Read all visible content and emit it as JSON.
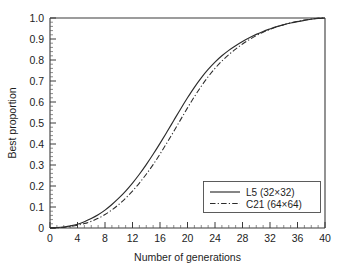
{
  "chart_data": {
    "type": "line",
    "title": "",
    "xlabel": "Number of generations",
    "ylabel": "Best proportion",
    "xlim": [
      0,
      40
    ],
    "ylim": [
      0,
      1.0
    ],
    "grid": false,
    "legend_position": "lower right",
    "x_ticks": [
      0,
      4,
      8,
      12,
      16,
      20,
      24,
      28,
      32,
      36,
      40
    ],
    "x_tick_labels": [
      "0",
      "4",
      "8",
      "12",
      "16",
      "20",
      "24",
      "28",
      "32",
      "36",
      "40"
    ],
    "x_minor_tick_step": 1,
    "y_ticks": [
      0,
      0.1,
      0.2,
      0.3,
      0.4,
      0.5,
      0.6,
      0.7,
      0.8,
      0.9,
      1.0
    ],
    "y_tick_labels": [
      "0",
      "0.1",
      "0.2",
      "0.3",
      "0.4",
      "0.5",
      "0.6",
      "0.7",
      "0.8",
      "0.9",
      "1.0"
    ],
    "y_minor_tick_step": 0.02,
    "x": [
      0,
      1,
      2,
      3,
      4,
      5,
      6,
      7,
      8,
      9,
      10,
      11,
      12,
      13,
      14,
      15,
      16,
      17,
      18,
      19,
      20,
      21,
      22,
      23,
      24,
      25,
      26,
      27,
      28,
      29,
      30,
      31,
      32,
      33,
      34,
      35,
      36,
      37,
      38,
      39,
      40
    ],
    "series": [
      {
        "name": "L5 (32×32)",
        "style": "solid",
        "color": "#2b2b2b",
        "values": [
          0.0,
          0.002,
          0.005,
          0.01,
          0.018,
          0.03,
          0.045,
          0.063,
          0.085,
          0.112,
          0.142,
          0.176,
          0.214,
          0.256,
          0.302,
          0.351,
          0.403,
          0.457,
          0.512,
          0.567,
          0.62,
          0.67,
          0.715,
          0.755,
          0.79,
          0.82,
          0.846,
          0.868,
          0.888,
          0.906,
          0.922,
          0.936,
          0.948,
          0.959,
          0.968,
          0.976,
          0.983,
          0.989,
          0.994,
          0.998,
          1.0
        ]
      },
      {
        "name": "C21 (64×64)",
        "style": "dash-dot",
        "color": "#2b2b2b",
        "values": [
          0.0,
          0.001,
          0.003,
          0.007,
          0.013,
          0.021,
          0.032,
          0.046,
          0.064,
          0.086,
          0.112,
          0.142,
          0.176,
          0.214,
          0.256,
          0.302,
          0.352,
          0.405,
          0.46,
          0.516,
          0.572,
          0.625,
          0.675,
          0.72,
          0.76,
          0.795,
          0.825,
          0.852,
          0.876,
          0.897,
          0.916,
          0.932,
          0.946,
          0.958,
          0.968,
          0.977,
          0.984,
          0.99,
          0.995,
          0.999,
          1.0
        ]
      }
    ],
    "legend": [
      {
        "label": "L5 (32×32)",
        "style": "solid"
      },
      {
        "label": "C21 (64×64)",
        "style": "dash-dot"
      }
    ]
  }
}
